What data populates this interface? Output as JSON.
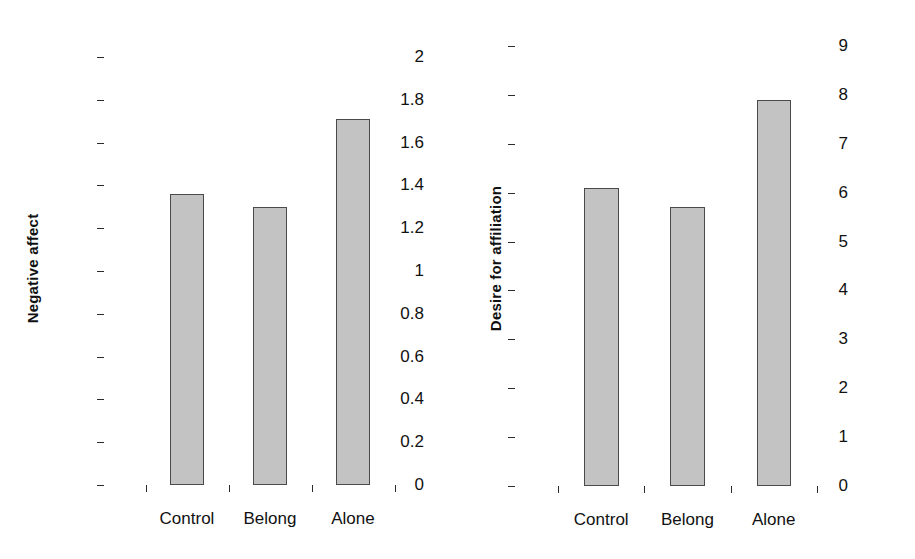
{
  "chart_data": [
    {
      "type": "bar",
      "panel": "left",
      "title": "",
      "xlabel": "",
      "ylabel": "Negative affect",
      "categories": [
        "Control",
        "Belong",
        "Alone"
      ],
      "values": [
        1.36,
        1.3,
        1.71
      ],
      "ylim": [
        0,
        2
      ],
      "ytick_values": [
        0,
        0.2,
        0.4,
        0.6,
        0.8,
        1,
        1.2,
        1.4,
        1.6,
        1.8,
        2
      ],
      "ytick_labels": [
        "0",
        "0.2",
        "0.4",
        "0.6",
        "0.8",
        "1",
        "1.2",
        "1.4",
        "1.6",
        "1.8",
        "2"
      ],
      "grid": false,
      "legend": false,
      "bar_fill": "#c3c3c3",
      "bar_edge": "#4a4a4a"
    },
    {
      "type": "bar",
      "panel": "right",
      "title": "",
      "xlabel": "",
      "ylabel": "Desire for affiliation",
      "categories": [
        "Control",
        "Belong",
        "Alone"
      ],
      "values": [
        6.1,
        5.7,
        7.9
      ],
      "ylim": [
        0,
        9
      ],
      "ytick_values": [
        0,
        1,
        2,
        3,
        4,
        5,
        6,
        7,
        8,
        9
      ],
      "ytick_labels": [
        "0",
        "1",
        "2",
        "3",
        "4",
        "5",
        "6",
        "7",
        "8",
        "9"
      ],
      "grid": false,
      "legend": false,
      "bar_fill": "#c3c3c3",
      "bar_edge": "#4a4a4a"
    }
  ]
}
